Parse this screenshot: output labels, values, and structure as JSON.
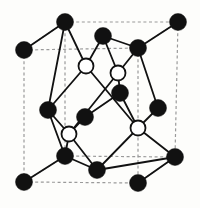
{
  "figure": {
    "background_color": "#fdfdfb"
  },
  "style": {
    "filled_atom_color": "#111111",
    "open_atom_fill": "#ffffff",
    "open_atom_stroke": "#111111",
    "bond_color": "#111111",
    "cell_edge_color": "#9a9a9a",
    "filled_atom_radius": 8.5,
    "open_atom_radius": 7.5,
    "bond_width": 1.8,
    "cell_edge_width": 1.2,
    "cell_edge_dash": "3,2.6"
  },
  "cell": {
    "label": "cubic unit cell",
    "corners": {
      "back_top_left": {
        "x": 24,
        "y": 50
      },
      "back_top_right": {
        "x": 138,
        "y": 48
      },
      "back_bottom_left": {
        "x": 24,
        "y": 182
      },
      "back_bottom_right": {
        "x": 138,
        "y": 183
      },
      "front_top_left": {
        "x": 65,
        "y": 22
      },
      "front_top_right": {
        "x": 178,
        "y": 22
      },
      "front_bottom_left": {
        "x": 65,
        "y": 156
      },
      "front_bottom_right": {
        "x": 175,
        "y": 157
      }
    },
    "edges": [
      {
        "name": "back-face-top",
        "x1": 24,
        "y1": 50,
        "x2": 138,
        "y2": 48
      },
      {
        "name": "back-face-bottom",
        "x1": 24,
        "y1": 182,
        "x2": 138,
        "y2": 183
      },
      {
        "name": "back-face-left",
        "x1": 24,
        "y1": 50,
        "x2": 24,
        "y2": 182
      },
      {
        "name": "back-face-right",
        "x1": 138,
        "y1": 48,
        "x2": 138,
        "y2": 183
      },
      {
        "name": "front-face-top",
        "x1": 65,
        "y1": 22,
        "x2": 178,
        "y2": 22
      },
      {
        "name": "front-face-bottom",
        "x1": 65,
        "y1": 156,
        "x2": 175,
        "y2": 157
      },
      {
        "name": "front-face-left",
        "x1": 65,
        "y1": 22,
        "x2": 65,
        "y2": 156
      },
      {
        "name": "front-face-right",
        "x1": 178,
        "y1": 22,
        "x2": 175,
        "y2": 157
      },
      {
        "name": "depth-top-left",
        "x1": 24,
        "y1": 50,
        "x2": 65,
        "y2": 22
      },
      {
        "name": "depth-top-right",
        "x1": 138,
        "y1": 48,
        "x2": 178,
        "y2": 22
      },
      {
        "name": "depth-bottom-left",
        "x1": 24,
        "y1": 182,
        "x2": 65,
        "y2": 156
      },
      {
        "name": "depth-bottom-right",
        "x1": 138,
        "y1": 183,
        "x2": 175,
        "y2": 157
      }
    ]
  },
  "atoms": {
    "filled": [
      {
        "id": "A1",
        "label": "corner-back-top-left",
        "x": 24,
        "y": 50
      },
      {
        "id": "A2",
        "label": "corner-front-top-left",
        "x": 65,
        "y": 22
      },
      {
        "id": "A3",
        "label": "face-top-center",
        "x": 103,
        "y": 36
      },
      {
        "id": "A4",
        "label": "corner-back-top-right",
        "x": 138,
        "y": 48
      },
      {
        "id": "A5",
        "label": "corner-front-top-right",
        "x": 178,
        "y": 22
      },
      {
        "id": "A6",
        "label": "face-left-center",
        "x": 48,
        "y": 110
      },
      {
        "id": "A7",
        "label": "interior-left",
        "x": 85,
        "y": 117
      },
      {
        "id": "A8",
        "label": "interior-right",
        "x": 120,
        "y": 93
      },
      {
        "id": "A9",
        "label": "face-right-center",
        "x": 158,
        "y": 108
      },
      {
        "id": "A10",
        "label": "corner-back-bottom-left",
        "x": 24,
        "y": 182
      },
      {
        "id": "A11",
        "label": "corner-front-bottom-left",
        "x": 65,
        "y": 156
      },
      {
        "id": "A12",
        "label": "face-bottom-center",
        "x": 97,
        "y": 170
      },
      {
        "id": "A13",
        "label": "corner-back-bottom-right",
        "x": 138,
        "y": 183
      },
      {
        "id": "A14",
        "label": "corner-front-bottom-right",
        "x": 175,
        "y": 157
      }
    ],
    "open": [
      {
        "id": "B1",
        "label": "tetrahedral-site-upper-left",
        "x": 86,
        "y": 66
      },
      {
        "id": "B2",
        "label": "tetrahedral-site-upper-right",
        "x": 118,
        "y": 73
      },
      {
        "id": "B3",
        "label": "tetrahedral-site-lower-left",
        "x": 69,
        "y": 134
      },
      {
        "id": "B4",
        "label": "tetrahedral-site-lower-right",
        "x": 138,
        "y": 128
      }
    ]
  },
  "bonds": [
    {
      "from": "B1",
      "to": "A2",
      "x1": 86,
      "y1": 66,
      "x2": 65,
      "y2": 22
    },
    {
      "from": "B1",
      "to": "A3",
      "x1": 86,
      "y1": 66,
      "x2": 103,
      "y2": 36
    },
    {
      "from": "B1",
      "to": "A6",
      "x1": 86,
      "y1": 66,
      "x2": 48,
      "y2": 110
    },
    {
      "from": "B1",
      "to": "B4",
      "x1": 86,
      "y1": 66,
      "x2": 138,
      "y2": 128
    },
    {
      "from": "B2",
      "to": "A3",
      "x1": 118,
      "y1": 73,
      "x2": 103,
      "y2": 36
    },
    {
      "from": "B2",
      "to": "A4",
      "x1": 118,
      "y1": 73,
      "x2": 138,
      "y2": 48
    },
    {
      "from": "B2",
      "to": "A8",
      "x1": 118,
      "y1": 73,
      "x2": 120,
      "y2": 93
    },
    {
      "from": "B2",
      "to": "B3",
      "x1": 118,
      "y1": 73,
      "x2": 69,
      "y2": 134
    },
    {
      "from": "B3",
      "to": "A6",
      "x1": 69,
      "y1": 134,
      "x2": 48,
      "y2": 110
    },
    {
      "from": "B3",
      "to": "A7",
      "x1": 69,
      "y1": 134,
      "x2": 85,
      "y2": 117
    },
    {
      "from": "B3",
      "to": "A11",
      "x1": 69,
      "y1": 134,
      "x2": 65,
      "y2": 156
    },
    {
      "from": "B3",
      "to": "A12",
      "x1": 69,
      "y1": 134,
      "x2": 97,
      "y2": 170
    },
    {
      "from": "B4",
      "to": "A8",
      "x1": 138,
      "y1": 128,
      "x2": 120,
      "y2": 93
    },
    {
      "from": "B4",
      "to": "A9",
      "x1": 138,
      "y1": 128,
      "x2": 158,
      "y2": 108
    },
    {
      "from": "B4",
      "to": "A12",
      "x1": 138,
      "y1": 128,
      "x2": 97,
      "y2": 170
    },
    {
      "from": "B4",
      "to": "A14",
      "x1": 138,
      "y1": 128,
      "x2": 175,
      "y2": 157
    },
    {
      "from": "A1",
      "to": "A2",
      "x1": 24,
      "y1": 50,
      "x2": 65,
      "y2": 22
    },
    {
      "from": "A2",
      "to": "A6",
      "x1": 65,
      "y1": 22,
      "x2": 48,
      "y2": 110
    },
    {
      "from": "A3",
      "to": "A4",
      "x1": 103,
      "y1": 36,
      "x2": 138,
      "y2": 48
    },
    {
      "from": "A4",
      "to": "A5",
      "x1": 138,
      "y1": 48,
      "x2": 178,
      "y2": 22
    },
    {
      "from": "A4",
      "to": "A9",
      "x1": 138,
      "y1": 48,
      "x2": 158,
      "y2": 108
    },
    {
      "from": "A6",
      "to": "A11",
      "x1": 48,
      "y1": 110,
      "x2": 65,
      "y2": 156
    },
    {
      "from": "A7",
      "to": "A8",
      "x1": 85,
      "y1": 117,
      "x2": 120,
      "y2": 93
    },
    {
      "from": "A10",
      "to": "A11",
      "x1": 24,
      "y1": 182,
      "x2": 65,
      "y2": 156
    },
    {
      "from": "A11",
      "to": "A12",
      "x1": 65,
      "y1": 156,
      "x2": 97,
      "y2": 170
    },
    {
      "from": "A12",
      "to": "A14",
      "x1": 97,
      "y1": 170,
      "x2": 175,
      "y2": 157
    },
    {
      "from": "A13",
      "to": "A14",
      "x1": 138,
      "y1": 183,
      "x2": 175,
      "y2": 157
    }
  ]
}
